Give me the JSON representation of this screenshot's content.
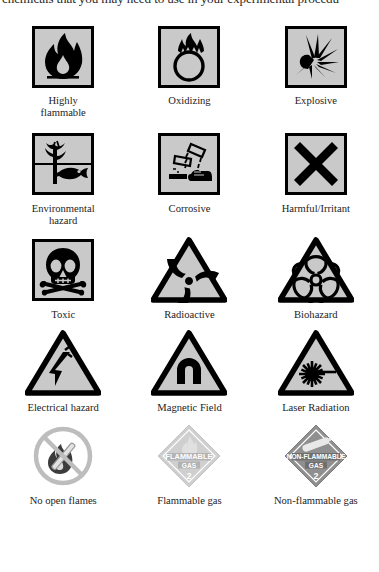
{
  "page": {
    "running_text_top": "chemicals that you may need to use in your experimental procedu",
    "background_color": "#ffffff",
    "symbol_fill_color": "#c9c9c9",
    "symbol_border_color": "#000000",
    "label_color": "#232323"
  },
  "symbols": [
    {
      "id": "highly-flammable",
      "label": "Highly\nflammable",
      "label_line1": "Highly",
      "label_line2": "flammable",
      "shape": "square",
      "icon": "flame-icon",
      "fill": "#c9c9c9"
    },
    {
      "id": "oxidizing",
      "label": "Oxidizing",
      "label_line1": "Oxidizing",
      "label_line2": "",
      "shape": "square",
      "icon": "flame-over-circle-icon",
      "fill": "#c9c9c9"
    },
    {
      "id": "explosive",
      "label": "Explosive",
      "label_line1": "Explosive",
      "label_line2": "",
      "shape": "square",
      "icon": "exploding-bomb-icon",
      "fill": "#c9c9c9"
    },
    {
      "id": "environmental-hazard",
      "label": "Environmental\nhazard",
      "label_line1": "Environmental",
      "label_line2": "hazard",
      "shape": "square",
      "icon": "dead-tree-and-fish-icon",
      "fill": "#c9c9c9"
    },
    {
      "id": "corrosive",
      "label": "Corrosive",
      "label_line1": "Corrosive",
      "label_line2": "",
      "shape": "square",
      "icon": "corrosion-test-tubes-icon",
      "fill": "#c9c9c9"
    },
    {
      "id": "harmful-irritant",
      "label": "Harmful/Irritant",
      "label_line1": "Harmful/Irritant",
      "label_line2": "",
      "shape": "square",
      "icon": "saint-andrews-cross-icon",
      "fill": "#c9c9c9"
    },
    {
      "id": "toxic",
      "label": "Toxic",
      "label_line1": "Toxic",
      "label_line2": "",
      "shape": "square",
      "icon": "skull-and-crossbones-icon",
      "fill": "#c9c9c9"
    },
    {
      "id": "radioactive",
      "label": "Radioactive",
      "label_line1": "Radioactive",
      "label_line2": "",
      "shape": "triangle",
      "icon": "radioactive-trefoil-icon",
      "fill": "#c9c9c9"
    },
    {
      "id": "biohazard",
      "label": "Biohazard",
      "label_line1": "Biohazard",
      "label_line2": "",
      "shape": "triangle",
      "icon": "biohazard-icon",
      "fill": "#c9c9c9"
    },
    {
      "id": "electrical-hazard",
      "label": "Electrical hazard",
      "label_line1": "Electrical hazard",
      "label_line2": "",
      "shape": "triangle",
      "icon": "lightning-bolt-icon",
      "fill": "#c9c9c9"
    },
    {
      "id": "magnetic-field",
      "label": "Magnetic Field",
      "label_line1": "Magnetic Field",
      "label_line2": "",
      "shape": "triangle",
      "icon": "horseshoe-magnet-icon",
      "fill": "#c9c9c9"
    },
    {
      "id": "laser-radiation",
      "label": "Laser Radiation",
      "label_line1": "Laser Radiation",
      "label_line2": "",
      "shape": "triangle",
      "icon": "laser-beam-icon",
      "fill": "#c9c9c9"
    },
    {
      "id": "no-open-flames",
      "label": "No open flames",
      "label_line1": "No open flames",
      "label_line2": "",
      "shape": "prohibition-circle",
      "icon": "no-open-flame-icon",
      "fill": "#ffffff",
      "ring_color": "#b9b9b9"
    },
    {
      "id": "flammable-gas",
      "label": "Flammable gas",
      "label_line1": "Flammable gas",
      "label_line2": "",
      "shape": "diamond",
      "icon": "flame-placard-icon",
      "fill": "#cfcfcf",
      "placard_text": "FLAMMABLE GAS",
      "placard_text_line1": "FLAMMABLE",
      "placard_text_line2": "GAS",
      "placard_class": "2"
    },
    {
      "id": "non-flammable-gas",
      "label": "Non-flammable gas",
      "label_line1": "Non-flammable gas",
      "label_line2": "",
      "shape": "diamond",
      "icon": "gas-cylinder-placard-icon",
      "fill": "#8f8f8f",
      "placard_text": "NON-FLAMMABLE GAS",
      "placard_text_line1": "NON-FLAMMABLE",
      "placard_text_line2": "GAS",
      "placard_class": "2"
    }
  ]
}
